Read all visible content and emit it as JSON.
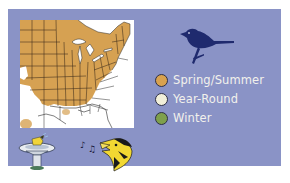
{
  "card": {
    "background": "#8a93c6"
  },
  "map": {
    "name": "range-map",
    "region": "Eastern United States",
    "colors": {
      "range_fill": "#d6a152",
      "background": "#ffffff",
      "borders": "#2a2a2a"
    }
  },
  "bird_silhouette": {
    "icon": "bird-silhouette-icon",
    "color": "#1f2a6e"
  },
  "legend": {
    "items": [
      {
        "label": "Spring/Summer",
        "color": "#d9a24f"
      },
      {
        "label": "Year-Round",
        "color": "#f1efd9"
      },
      {
        "label": "Winter",
        "color": "#7ea04c"
      }
    ]
  },
  "icons": {
    "birdbath": "birdbath-icon",
    "singing_bird": "singing-bird-icon"
  }
}
